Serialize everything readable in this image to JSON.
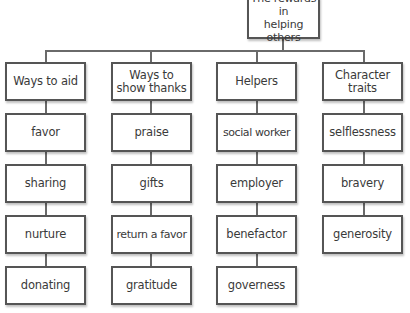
{
  "title": "The rewards in helping others",
  "title_lines": [
    "The rewards in",
    "helping others"
  ],
  "columns": [
    {
      "header": "Ways to aid",
      "items": [
        "favor",
        "sharing",
        "nurture",
        "donating"
      ]
    },
    {
      "header": "Ways to show thanks",
      "items": [
        "praise",
        "gifts",
        "return a favor",
        "gratitude"
      ]
    },
    {
      "header": "Helpers",
      "items": [
        "social worker",
        "employer",
        "benefactor",
        "governess"
      ]
    },
    {
      "header": "Character traits",
      "items": [
        "selflessness",
        "bravery",
        "generosity"
      ]
    }
  ]
}
